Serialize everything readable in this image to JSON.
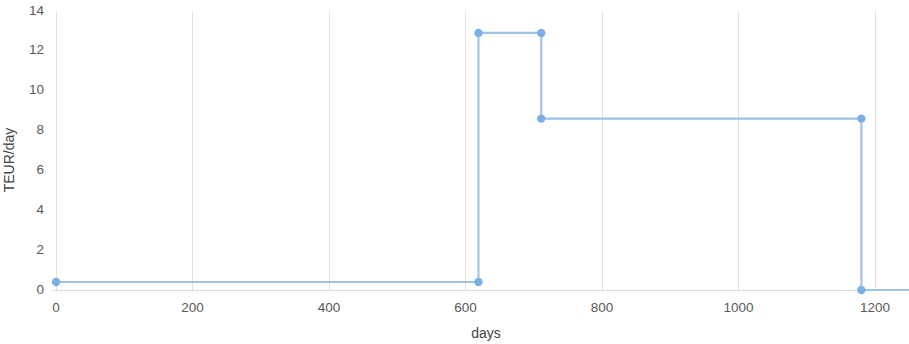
{
  "chart_data": {
    "type": "line",
    "subtype": "step-post",
    "title": "",
    "xlabel": "days",
    "ylabel": "TEUR/day",
    "xlim": [
      0,
      1252
    ],
    "ylim": [
      0,
      14
    ],
    "xticks": [
      0,
      200,
      400,
      600,
      800,
      1000,
      1200
    ],
    "xtick_labels": [
      "0",
      "200",
      "400",
      "600",
      "800",
      "1000",
      "1200"
    ],
    "yticks": [
      0,
      2,
      4,
      6,
      8,
      10,
      12,
      14
    ],
    "ytick_labels": [
      "0",
      "2",
      "4",
      "6",
      "8",
      "10",
      "12",
      "14"
    ],
    "grid": {
      "x": true,
      "y": false,
      "color": "#d9d9d9"
    },
    "legend": {
      "visible": false,
      "position": "none"
    },
    "series": [
      {
        "name": "TEUR/day",
        "line_color": "#9dc3e6",
        "marker_color": "#7cafe4",
        "marker_radius": 4.2,
        "x": [
          0,
          619,
          619,
          711,
          711,
          1180,
          1180,
          1252
        ],
        "y": [
          0.4,
          0.4,
          12.9,
          12.9,
          8.6,
          8.6,
          0.0,
          0.0
        ],
        "markers": [
          {
            "x": 0,
            "y": 0.4
          },
          {
            "x": 619,
            "y": 0.4
          },
          {
            "x": 619,
            "y": 12.9
          },
          {
            "x": 711,
            "y": 12.9
          },
          {
            "x": 711,
            "y": 8.6
          },
          {
            "x": 1180,
            "y": 8.6
          },
          {
            "x": 1180,
            "y": 0.0
          }
        ]
      }
    ],
    "steps": [
      {
        "from_day": 0,
        "to_day": 619,
        "value": 0.4
      },
      {
        "from_day": 619,
        "to_day": 711,
        "value": 12.9
      },
      {
        "from_day": 711,
        "to_day": 1180,
        "value": 8.6
      },
      {
        "from_day": 1180,
        "to_day": 1252,
        "value": 0.0
      }
    ]
  }
}
